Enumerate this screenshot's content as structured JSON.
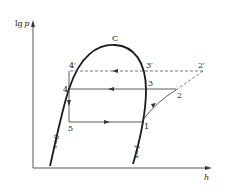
{
  "diagram": {
    "type": "lgp-h refrigeration cycle diagram",
    "axes": {
      "y_label_prefix": "lg",
      "y_label_var": "p",
      "x_label": "h"
    },
    "critical_point": {
      "label": "C"
    },
    "saturation_lines": {
      "liquid": "x=0",
      "vapor": "x=1"
    },
    "points": {
      "p1": "1",
      "p2": "2",
      "p2prime": "2′",
      "p3": "3",
      "p3prime": "3′",
      "p4": "4",
      "p4prime": "4′",
      "p5": "5"
    },
    "colors": {
      "line": "#1a1a1a",
      "dashed": "#555555",
      "background": "#ffffff"
    }
  }
}
